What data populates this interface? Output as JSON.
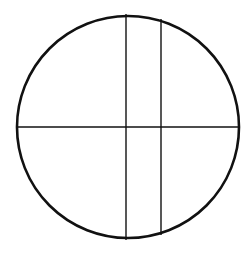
{
  "diagram": {
    "type": "circle-divided-by-lines",
    "background": "#ffffff",
    "stroke_color": "#111111",
    "circle": {
      "cx": 128,
      "cy": 127,
      "r": 111,
      "stroke_width": 2.6
    },
    "lines": [
      {
        "name": "horizontal-diameter",
        "x1": 17,
        "y1": 127,
        "x2": 239,
        "y2": 127,
        "stroke_width": 1.4
      },
      {
        "name": "vertical-center-line",
        "x1": 126,
        "y1": 14,
        "x2": 126,
        "y2": 240,
        "stroke_width": 1.4
      },
      {
        "name": "vertical-right-chord",
        "x1": 161,
        "y1": 19,
        "x2": 161,
        "y2": 235,
        "stroke_width": 1.4
      }
    ]
  }
}
